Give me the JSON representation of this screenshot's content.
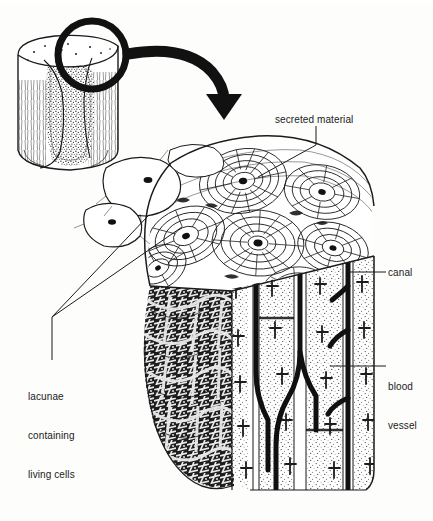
{
  "figure": {
    "title": "SKELETAL SYSTEM",
    "title_note": "partially cropped at top edge of image",
    "background_color": "#fdfdfb",
    "ink_color": "#1b1b1b",
    "medium": "pen-and-ink anatomical line illustration"
  },
  "labels": [
    {
      "id": "secreted-material",
      "text": "secreted material",
      "lines": [
        "secreted material"
      ],
      "x": 275,
      "y": 113,
      "leader": "elbow line down-left to osteon on top surface"
    },
    {
      "id": "canal",
      "text": "canal",
      "lines": [
        "canal"
      ],
      "x": 388,
      "y": 266,
      "leader": "short horizontal line left to vertical canal"
    },
    {
      "id": "blood-vessel",
      "text": "blood vessel",
      "lines": [
        "blood",
        "vessel"
      ],
      "x": 388,
      "y": 354,
      "leader": "short horizontal line left to vessel in cut face"
    },
    {
      "id": "lacunae",
      "text": "lacunae containing living cells",
      "lines": [
        "lacunae",
        "containing",
        "living cells"
      ],
      "x": 28,
      "y": 364,
      "leader": "vertical stem rising to a vertex, then two diagonals to lacunae"
    }
  ],
  "parts": {
    "inset_bone": {
      "name": "cut bone shaft section",
      "note": "small inset at upper left showing spongy interior and compact wall"
    },
    "magnifier": {
      "name": "magnification circle",
      "note": "thick black ring over upper right of inset bone"
    },
    "arrow": {
      "name": "curved magnification arrow",
      "note": "thick arrow curving right then pointing down toward enlarged block"
    },
    "main_block": {
      "name": "enlarged wedge of compact bone",
      "note": "top surface with concentric osteons, cut front face with canals, spongy bone at lower left"
    },
    "osteons": {
      "name": "concentric lamellae rings",
      "count_visible": 7
    },
    "lacunae_cells": {
      "name": "large oval lacunae with dark nuclei",
      "count_visible": 3
    }
  },
  "colors": {
    "ink": "#1b1b1b",
    "paper": "#fdfdfb",
    "stipple": "#555555",
    "label_text": "#1b1b1b"
  }
}
